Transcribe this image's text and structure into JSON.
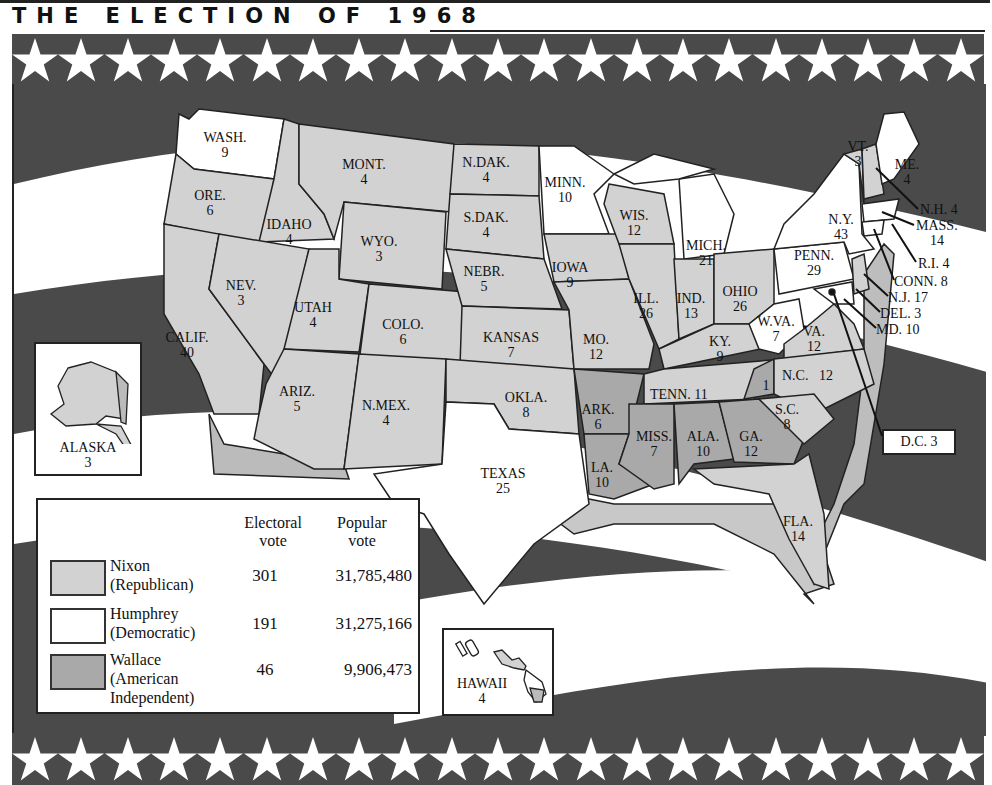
{
  "title": "THE ELECTION OF 1968",
  "colors": {
    "nixon": "#d2d2d2",
    "humphrey": "#ffffff",
    "wallace": "#a9a9a9",
    "stripe_dark": "#4a4a4a",
    "stripe_light": "#ffffff",
    "outline": "#222222"
  },
  "legend": {
    "col_electoral": "Electoral\nvote",
    "col_electoral_l1": "Electoral",
    "col_electoral_l2": "vote",
    "col_popular_l1": "Popular",
    "col_popular_l2": "vote",
    "candidates": [
      {
        "name_l1": "Nixon",
        "name_l2": "(Republican)",
        "name_l3": "",
        "electoral": "301",
        "popular": "31,785,480",
        "color": "#d2d2d2"
      },
      {
        "name_l1": "Humphrey",
        "name_l2": "(Democratic)",
        "name_l3": "",
        "electoral": "191",
        "popular": "31,275,166",
        "color": "#ffffff"
      },
      {
        "name_l1": "Wallace",
        "name_l2": "(American",
        "name_l3": "Independent)",
        "electoral": "46",
        "popular": "9,906,473",
        "color": "#a9a9a9"
      }
    ]
  },
  "states": [
    {
      "abbr": "WASH.",
      "ev": "9",
      "winner": "Humphrey"
    },
    {
      "abbr": "ORE.",
      "ev": "6",
      "winner": "Nixon"
    },
    {
      "abbr": "CALIF.",
      "ev": "40",
      "winner": "Nixon"
    },
    {
      "abbr": "IDAHO",
      "ev": "4",
      "winner": "Nixon"
    },
    {
      "abbr": "NEV.",
      "ev": "3",
      "winner": "Nixon"
    },
    {
      "abbr": "MONT.",
      "ev": "4",
      "winner": "Nixon"
    },
    {
      "abbr": "WYO.",
      "ev": "3",
      "winner": "Nixon"
    },
    {
      "abbr": "UTAH",
      "ev": "4",
      "winner": "Nixon"
    },
    {
      "abbr": "COLO.",
      "ev": "6",
      "winner": "Nixon"
    },
    {
      "abbr": "ARIZ.",
      "ev": "5",
      "winner": "Nixon"
    },
    {
      "abbr": "N.MEX.",
      "ev": "4",
      "winner": "Nixon"
    },
    {
      "abbr": "N.DAK.",
      "ev": "4",
      "winner": "Nixon"
    },
    {
      "abbr": "S.DAK.",
      "ev": "4",
      "winner": "Nixon"
    },
    {
      "abbr": "NEBR.",
      "ev": "5",
      "winner": "Nixon"
    },
    {
      "abbr": "KANSAS",
      "ev": "7",
      "winner": "Nixon"
    },
    {
      "abbr": "OKLA.",
      "ev": "8",
      "winner": "Nixon"
    },
    {
      "abbr": "TEXAS",
      "ev": "25",
      "winner": "Humphrey"
    },
    {
      "abbr": "MINN.",
      "ev": "10",
      "winner": "Humphrey"
    },
    {
      "abbr": "IOWA",
      "ev": "9",
      "winner": "Nixon"
    },
    {
      "abbr": "MO.",
      "ev": "12",
      "winner": "Nixon"
    },
    {
      "abbr": "ARK.",
      "ev": "6",
      "winner": "Wallace"
    },
    {
      "abbr": "LA.",
      "ev": "10",
      "winner": "Wallace"
    },
    {
      "abbr": "WIS.",
      "ev": "12",
      "winner": "Nixon"
    },
    {
      "abbr": "ILL.",
      "ev": "26",
      "winner": "Nixon"
    },
    {
      "abbr": "MICH.",
      "ev": "21",
      "winner": "Humphrey"
    },
    {
      "abbr": "IND.",
      "ev": "13",
      "winner": "Nixon"
    },
    {
      "abbr": "OHIO",
      "ev": "26",
      "winner": "Nixon"
    },
    {
      "abbr": "KY.",
      "ev": "9",
      "winner": "Nixon"
    },
    {
      "abbr": "TENN.",
      "ev": "11",
      "winner": "Nixon"
    },
    {
      "abbr": "MISS.",
      "ev": "7",
      "winner": "Wallace"
    },
    {
      "abbr": "ALA.",
      "ev": "10",
      "winner": "Wallace"
    },
    {
      "abbr": "GA.",
      "ev": "12",
      "winner": "Wallace"
    },
    {
      "abbr": "FLA.",
      "ev": "14",
      "winner": "Nixon"
    },
    {
      "abbr": "S.C.",
      "ev": "8",
      "winner": "Nixon"
    },
    {
      "abbr": "N.C.",
      "ev": "12",
      "winner": "Nixon",
      "faithless": "1"
    },
    {
      "abbr": "VA.",
      "ev": "12",
      "winner": "Nixon"
    },
    {
      "abbr": "W.VA.",
      "ev": "7",
      "winner": "Humphrey"
    },
    {
      "abbr": "PENN.",
      "ev": "29",
      "winner": "Humphrey"
    },
    {
      "abbr": "N.Y.",
      "ev": "43",
      "winner": "Humphrey"
    },
    {
      "abbr": "VT.",
      "ev": "3",
      "winner": "Nixon"
    },
    {
      "abbr": "ME.",
      "ev": "4",
      "winner": "Humphrey"
    },
    {
      "abbr": "N.H.",
      "ev": "4",
      "winner": "Nixon"
    },
    {
      "abbr": "MASS.",
      "ev": "14",
      "winner": "Humphrey"
    },
    {
      "abbr": "R.I.",
      "ev": "4",
      "winner": "Humphrey"
    },
    {
      "abbr": "CONN.",
      "ev": "8",
      "winner": "Humphrey"
    },
    {
      "abbr": "N.J.",
      "ev": "17",
      "winner": "Nixon"
    },
    {
      "abbr": "DEL.",
      "ev": "3",
      "winner": "Nixon"
    },
    {
      "abbr": "MD.",
      "ev": "10",
      "winner": "Humphrey"
    },
    {
      "abbr": "D.C.",
      "ev": "3",
      "winner": "Humphrey"
    },
    {
      "abbr": "ALASKA",
      "ev": "3",
      "winner": "Nixon"
    },
    {
      "abbr": "HAWAII",
      "ev": "4",
      "winner": "Humphrey"
    }
  ],
  "labels": {
    "nc_faithless": "1",
    "ne_callouts": {
      "nh": "N.H. 4",
      "mass_l1": "MASS.",
      "mass_l2": "14",
      "ri": "R.I. 4",
      "conn": "CONN. 8",
      "nj": "N.J.  17",
      "del": "DEL. 3",
      "md": "MD. 10",
      "dc": "D.C. 3"
    },
    "tenn": "TENN.  11",
    "nc_l1": "N.C.",
    "nc_l2": "12"
  }
}
